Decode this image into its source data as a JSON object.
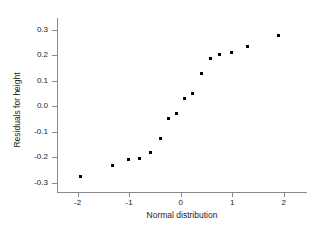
{
  "chart_data": {
    "type": "scatter",
    "title": "",
    "xlabel": "Normal distribution",
    "ylabel": "Residuals for height",
    "xlim": [
      -2.4,
      2.45
    ],
    "ylim": [
      -0.335,
      0.345
    ],
    "xticks": [
      -2,
      -1,
      0,
      1,
      2
    ],
    "xticklabels": [
      "-2",
      "-1",
      "0",
      "1",
      "2"
    ],
    "yticks": [
      -0.3,
      -0.2,
      -0.1,
      0.0,
      0.1,
      0.2,
      0.3
    ],
    "yticklabels": [
      "-0.3",
      "-0.2",
      "-0.1",
      "0.0",
      "0.1",
      "0.2",
      "0.3"
    ],
    "grid": false,
    "legend": "none",
    "marker": "square",
    "marker_color": "#000000",
    "axis_color": "#8a8a8a",
    "points": [
      {
        "x": -1.94,
        "y": -0.275
      },
      {
        "x": -1.33,
        "y": -0.231
      },
      {
        "x": -1.01,
        "y": -0.207
      },
      {
        "x": -0.8,
        "y": -0.203
      },
      {
        "x": -0.58,
        "y": -0.182
      },
      {
        "x": -0.4,
        "y": -0.127
      },
      {
        "x": -0.23,
        "y": -0.046
      },
      {
        "x": -0.08,
        "y": -0.028
      },
      {
        "x": 0.08,
        "y": 0.031
      },
      {
        "x": 0.23,
        "y": 0.049
      },
      {
        "x": 0.4,
        "y": 0.13
      },
      {
        "x": 0.58,
        "y": 0.185
      },
      {
        "x": 0.76,
        "y": 0.204
      },
      {
        "x": 0.99,
        "y": 0.209
      },
      {
        "x": 1.3,
        "y": 0.233
      },
      {
        "x": 1.9,
        "y": 0.277
      }
    ]
  }
}
